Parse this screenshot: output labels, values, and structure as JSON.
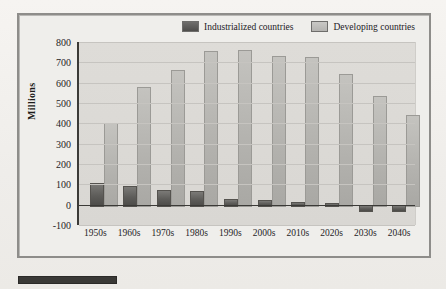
{
  "chart_data": {
    "type": "bar",
    "title": "",
    "xlabel": "",
    "ylabel": "Millions",
    "ylim": [
      -100,
      800
    ],
    "yticks": [
      800,
      700,
      600,
      500,
      400,
      300,
      200,
      100,
      0,
      -100
    ],
    "grid": true,
    "legend_position": "top-right",
    "categories": [
      "1950s",
      "1960s",
      "1970s",
      "1980s",
      "1990s",
      "2000s",
      "2010s",
      "2020s",
      "2030s",
      "2040s"
    ],
    "series": [
      {
        "name": "Industrialized countries",
        "color": "#5d5c59",
        "values": [
          105,
          90,
          70,
          65,
          30,
          25,
          15,
          8,
          -25,
          -28
        ]
      },
      {
        "name": "Developing countries",
        "color": "#b3b2ae",
        "values": [
          400,
          580,
          660,
          755,
          760,
          730,
          725,
          645,
          535,
          440
        ]
      }
    ]
  },
  "legend": {
    "entries": [
      {
        "label": "Industrialized countries",
        "swatch": "dark-swatch-icon"
      },
      {
        "label": "Developing countries",
        "swatch": "light-swatch-icon"
      }
    ]
  }
}
